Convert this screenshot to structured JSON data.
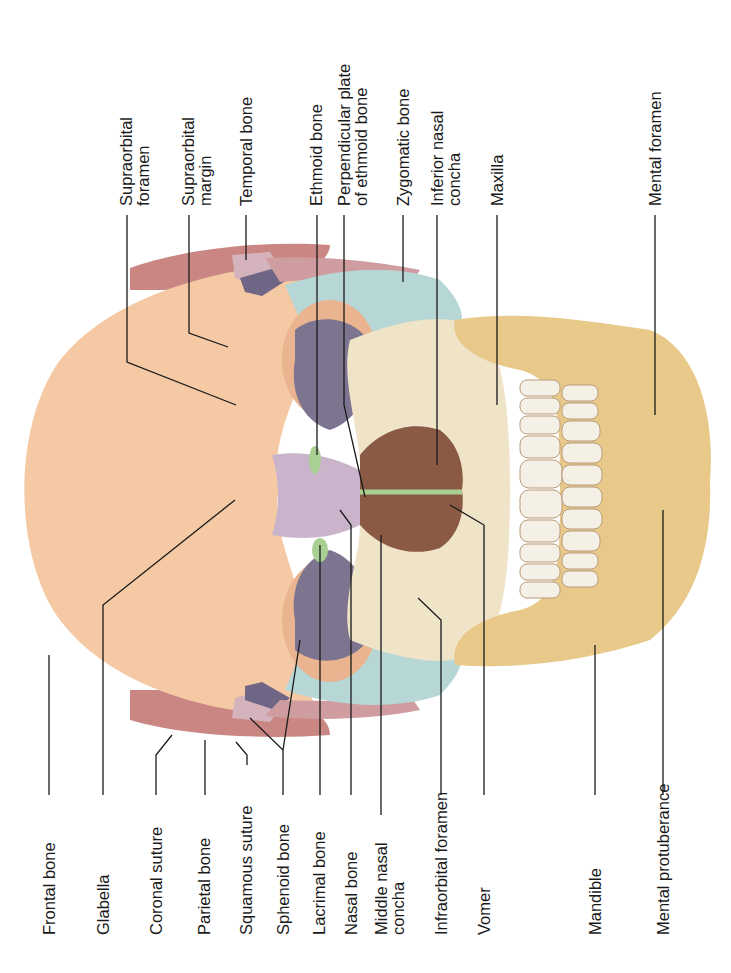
{
  "figure": {
    "colors": {
      "frontal": "#f4c9a3",
      "parietal": "#c98682",
      "temporal": "#d4b3bd",
      "sphenoid": "#8a7e9a",
      "zygomatic": "#b7d6d6",
      "maxilla": "#efe3c8",
      "mandible": "#e8c98a",
      "nasal": "#c9b4cc",
      "ethmoid": "#a9cf93",
      "cavity": "#8a5a45",
      "orbit_floor": "#7d7490"
    }
  },
  "labels_bottom": [
    {
      "text": "Frontal bone"
    },
    {
      "text": "Glabella"
    },
    {
      "text": "Coronal suture"
    },
    {
      "text": "Parietal bone"
    },
    {
      "text": "Squamous suture"
    },
    {
      "text": "Sphenoid bone"
    },
    {
      "text": "Lacrimal bone"
    },
    {
      "text": "Nasal bone"
    },
    {
      "text": "Middle nasal\nconcha"
    },
    {
      "text": "Infraorbital foramen"
    },
    {
      "text": "Vomer"
    },
    {
      "text": "Mandible"
    },
    {
      "text": "Mental protuberance"
    }
  ],
  "labels_top": [
    {
      "text": "Supraorbital\nforamen"
    },
    {
      "text": "Supraorbital\nmargin"
    },
    {
      "text": "Temporal bone"
    },
    {
      "text": "Ethmoid bone"
    },
    {
      "text": "Perpendicular plate\nof ethmoid bone"
    },
    {
      "text": "Zygomatic bone"
    },
    {
      "text": "Inferior nasal\nconcha"
    },
    {
      "text": "Maxilla"
    },
    {
      "text": "Mental foramen"
    }
  ]
}
